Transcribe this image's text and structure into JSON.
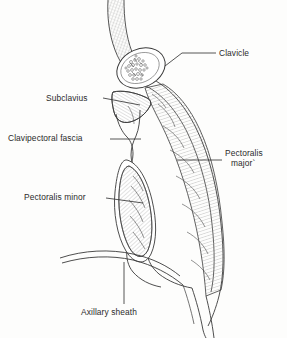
{
  "figure": {
    "type": "anatomical-line-drawing",
    "background_color": "#fdfdfc",
    "ink_color": "#2b2b2b",
    "width": 287,
    "height": 338
  },
  "labels": {
    "clavicle": "Clavicle",
    "subclavius": "Subclavius",
    "clavipectoral_fascia": "Clavipectoral fascia",
    "pectoralis_major_line1": "Pectoralis",
    "pectoralis_major_line2": "major`",
    "pectoralis_minor": "Pectoralis minor",
    "axillary_sheath": "Axillary sheath"
  },
  "structures": [
    {
      "name": "clavicle",
      "description": "oval bone cross-section with trabecular stippling"
    },
    {
      "name": "subclavius",
      "description": "triangular hatched muscle beneath the clavicle"
    },
    {
      "name": "clavipectoral-fascia",
      "description": "narrow double-line fascial band descending from clavicle"
    },
    {
      "name": "pectoralis-major",
      "description": "long hatched muscle belly along the anterior chest wall"
    },
    {
      "name": "pectoralis-minor",
      "description": "elongated oval hatched muscle within the fascial split"
    },
    {
      "name": "axillary-sheath",
      "description": "curved double-line arc sweeping from the left toward the axilla"
    },
    {
      "name": "skin-superficial-layer",
      "description": "finely cross-hatched band at the superior neck region"
    }
  ],
  "leaders": [
    {
      "name": "leader-clavicle",
      "from": [
        216,
        53
      ],
      "to": [
        165,
        66
      ]
    },
    {
      "name": "leader-subclavius",
      "from": [
        103,
        98
      ],
      "to": [
        140,
        105
      ]
    },
    {
      "name": "leader-fascia",
      "from": [
        110,
        139
      ],
      "to": [
        141,
        139
      ]
    },
    {
      "name": "leader-pecmajor",
      "from": [
        222,
        160
      ],
      "to": [
        177,
        160
      ]
    },
    {
      "name": "leader-pecminor",
      "from": [
        106,
        198
      ],
      "to": [
        143,
        203
      ]
    },
    {
      "name": "leader-axillary",
      "from": [
        124,
        304
      ],
      "to": [
        124,
        262
      ]
    }
  ]
}
